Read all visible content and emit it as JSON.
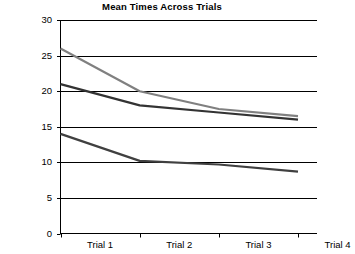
{
  "chart_data": {
    "type": "line",
    "title": "Mean Times Across Trials",
    "xlabel": "",
    "ylabel": "",
    "categories": [
      "Trial 1",
      "Trial 2",
      "Trial 3",
      "Trial 4"
    ],
    "series": [
      {
        "name": "series-gray",
        "color": "#808080",
        "values": [
          26.0,
          20.0,
          17.5,
          16.5
        ]
      },
      {
        "name": "series-dark-upper",
        "color": "#333333",
        "values": [
          21.0,
          18.0,
          17.0,
          16.0
        ]
      },
      {
        "name": "series-dark-lower",
        "color": "#404040",
        "values": [
          14.0,
          10.2,
          9.7,
          8.7
        ]
      }
    ],
    "ylim": [
      0,
      30
    ],
    "yticks": [
      0,
      5,
      10,
      15,
      20,
      25,
      30
    ],
    "ytick_labels": [
      "0",
      "5",
      "10",
      "15",
      "20",
      "25",
      "30"
    ],
    "grid": true,
    "grid_axis": "y",
    "legend": false,
    "legend_position": "none",
    "markers": false
  },
  "axis": {
    "y_labels": [
      "30",
      "25",
      "20",
      "15",
      "10",
      "5",
      "0"
    ],
    "x_labels": [
      "Trial 1",
      "Trial 2",
      "Trial 3",
      "Trial 4"
    ]
  },
  "colors": {
    "background": "#ffffff",
    "axis": "#000000",
    "gridline": "#000000",
    "series_gray": "#808080",
    "series_dark_upper": "#333333",
    "series_dark_lower": "#404040"
  }
}
